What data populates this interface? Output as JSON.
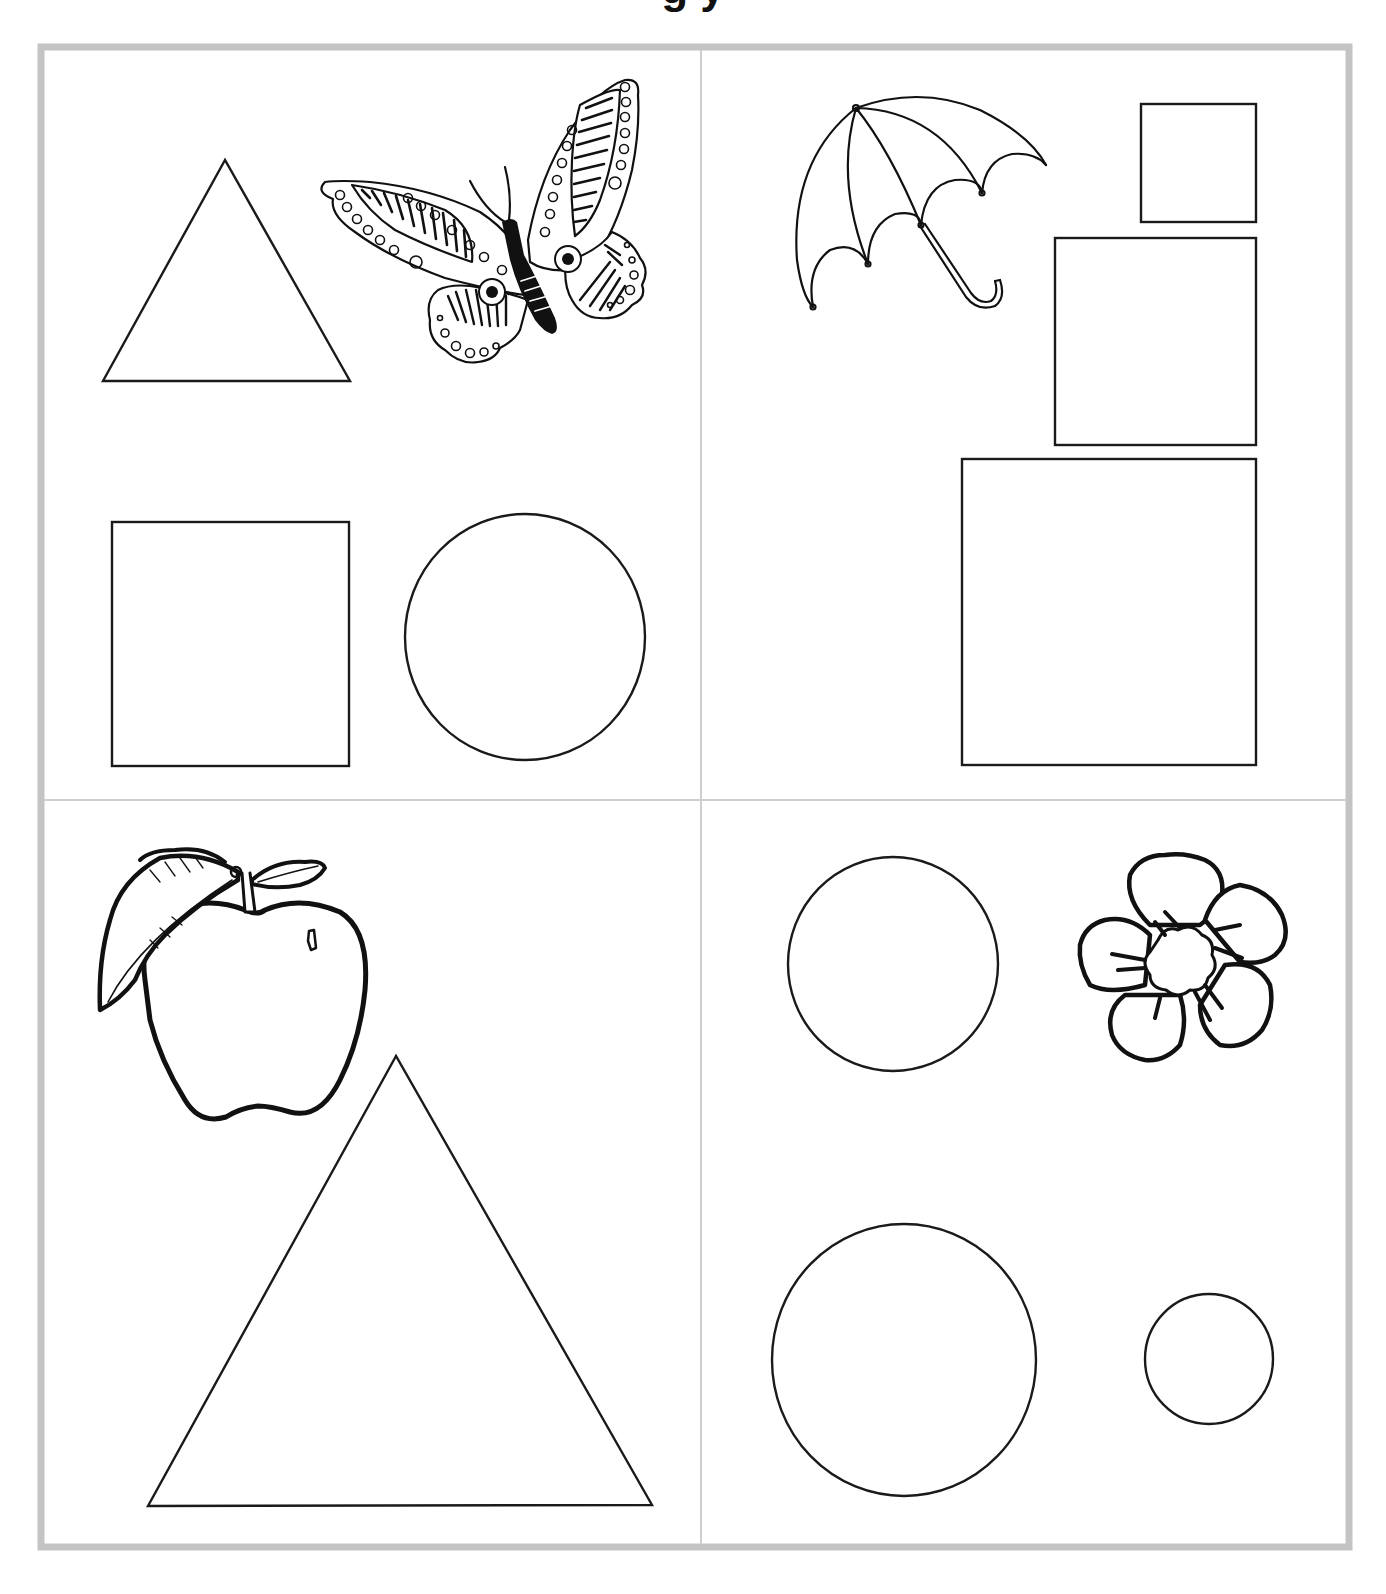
{
  "worksheet": {
    "title_remnant": "g                         y",
    "frame": {
      "x": 41,
      "y": 47,
      "width": 1308,
      "height": 1500,
      "color": "#c4c4c4",
      "stroke_width": 7
    },
    "dividers": {
      "vertical_x": 701,
      "horizontal_y": 800,
      "color": "#cfcfcf"
    },
    "line_color": "#1a1a1a",
    "panels": [
      {
        "id": "top-left",
        "picture": "butterfly",
        "shapes": [
          {
            "type": "triangle",
            "label": "triangle",
            "points": [
              [
                225,
                160
              ],
              [
                103,
                381
              ],
              [
                350,
                381
              ]
            ]
          },
          {
            "type": "square",
            "label": "square",
            "x": 112,
            "y": 522,
            "w": 237,
            "h": 244
          },
          {
            "type": "circle",
            "label": "circle",
            "cx": 525,
            "cy": 637,
            "rx": 120,
            "ry": 123
          }
        ]
      },
      {
        "id": "top-right",
        "picture": "umbrella",
        "shapes": [
          {
            "type": "square",
            "label": "small-square",
            "x": 1141,
            "y": 104,
            "w": 115,
            "h": 118
          },
          {
            "type": "square",
            "label": "medium-square",
            "x": 1055,
            "y": 238,
            "w": 201,
            "h": 207
          },
          {
            "type": "square",
            "label": "large-square",
            "x": 962,
            "y": 459,
            "w": 294,
            "h": 306
          }
        ]
      },
      {
        "id": "bottom-left",
        "picture": "apple",
        "shapes": [
          {
            "type": "triangle",
            "label": "large-triangle",
            "points": [
              [
                396,
                1056
              ],
              [
                148,
                1506
              ],
              [
                652,
                1505
              ]
            ]
          }
        ]
      },
      {
        "id": "bottom-right",
        "picture": "flower",
        "shapes": [
          {
            "type": "circle",
            "label": "medium-circle",
            "cx": 893,
            "cy": 964,
            "rx": 105,
            "ry": 107
          },
          {
            "type": "circle",
            "label": "large-circle",
            "cx": 904,
            "cy": 1360,
            "rx": 132,
            "ry": 136
          },
          {
            "type": "circle",
            "label": "small-circle",
            "cx": 1209,
            "cy": 1359,
            "rx": 64,
            "ry": 65
          }
        ]
      }
    ]
  }
}
